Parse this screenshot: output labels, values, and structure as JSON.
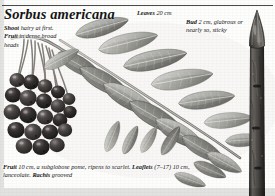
{
  "page": {
    "title": "Sorbus americana",
    "species_title_style": "italic-bold-serif",
    "background_color": "#fdfdfc",
    "ink_color": "#141414",
    "rule_color": "#4a4a4a"
  },
  "captions": {
    "shoot": {
      "label_1": "Shoot",
      "text_1": " hairy at first. ",
      "label_2": "Fruit",
      "text_2": " in dense broad heads"
    },
    "leaves": {
      "label": "Leaves",
      "text": " 20 cm"
    },
    "bud": {
      "label": "Bud",
      "text": " 2 cm, glabrous or nearly so, sticky"
    },
    "fruit": {
      "label_1": "Fruit",
      "text_1": " 10 cm, a subglobose pome, ripens to scarlet. ",
      "label_2": "Leaflets",
      "text_2": " (7–17) 10 cm, lanceolate. ",
      "label_3": "Rachis",
      "text_3": " grooved"
    }
  },
  "illustration": {
    "subject": "Sorbus americana (American mountain-ash) plate",
    "elements": [
      {
        "name": "fruit-cluster",
        "description": "dense broad head of dark subglobose pomes, lower left"
      },
      {
        "name": "compound-leaf",
        "description": "pinnate leaf with 7-17 lanceolate leaflets on a grooved rachis, centre"
      },
      {
        "name": "shoot-twig",
        "description": "hairy shoot bearing the fruit head and leaf, upper left"
      },
      {
        "name": "winter-twig-with-bud",
        "description": "dark twig with pointed glabrous sticky terminal bud, right edge"
      }
    ],
    "palette": {
      "leaf_light": "#b4b4b0",
      "leaf_mid": "#8e8e8a",
      "leaf_dark": "#6a6a66",
      "vein": "#f0efec",
      "fruit_dark": "#2d2b2a",
      "fruit_mid": "#464341",
      "fruit_highlight": "#7c7774",
      "twig_dark": "#3a3836",
      "twig_mid": "#6f6c68",
      "stem": "#8b8883"
    }
  }
}
